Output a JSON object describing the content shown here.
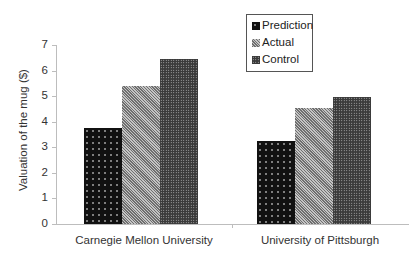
{
  "chart_data": {
    "type": "bar",
    "title": "",
    "xlabel": "",
    "ylabel": "Valuation of the mug ($)",
    "ylim": [
      0,
      7
    ],
    "yticks": [
      0,
      1,
      2,
      3,
      4,
      5,
      6,
      7
    ],
    "grid": false,
    "legend_position": "top-right (inside)",
    "categories": [
      "Carnegie Mellon University",
      "University of Pittsburgh"
    ],
    "series": [
      {
        "name": "Prediction",
        "values": [
          3.74,
          3.26
        ],
        "pattern": "black with white dots"
      },
      {
        "name": "Actual",
        "values": [
          5.4,
          4.55
        ],
        "pattern": "gray fine checker"
      },
      {
        "name": "Control",
        "values": [
          6.47,
          4.97
        ],
        "pattern": "dark dense dots"
      }
    ]
  },
  "axis": {
    "ylabel": "Valuation of the mug ($)",
    "yticks": [
      "0",
      "1",
      "2",
      "3",
      "4",
      "5",
      "6",
      "7"
    ],
    "categories": [
      "Carnegie Mellon University",
      "University of Pittsburgh"
    ]
  },
  "legend": {
    "items": [
      "Prediction",
      "Actual",
      "Control"
    ]
  }
}
